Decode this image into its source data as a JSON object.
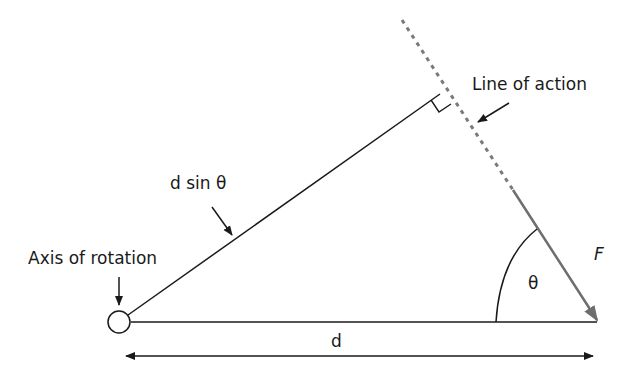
{
  "diagram": {
    "type": "torque-moment-arm",
    "labels": {
      "line_of_action": "Line of action",
      "moment_arm": "d sin θ",
      "axis_of_rotation": "Axis of rotation",
      "force": "F",
      "angle": "θ",
      "distance": "d"
    },
    "colors": {
      "line": "#1a1a1a",
      "force": "#6e6e6e",
      "dashed": "#7a7a7a",
      "background": "#ffffff"
    },
    "elements": {
      "pivot": {
        "cx": 119,
        "cy": 322,
        "r": 11
      },
      "baseline": {
        "x1": 131,
        "y1": 322,
        "x2": 597,
        "y2": 322
      },
      "moment_arm_line": {
        "x1": 128,
        "y1": 316,
        "x2": 440,
        "y2": 94
      },
      "line_of_action_dashed": {
        "x1": 402,
        "y1": 20,
        "x2": 513,
        "y2": 190
      },
      "force_arrow": {
        "x1": 513,
        "y1": 190,
        "x2": 597,
        "y2": 320
      },
      "distance_arrow": {
        "x1": 126,
        "y1": 356,
        "x2": 593,
        "y2": 356
      }
    }
  }
}
